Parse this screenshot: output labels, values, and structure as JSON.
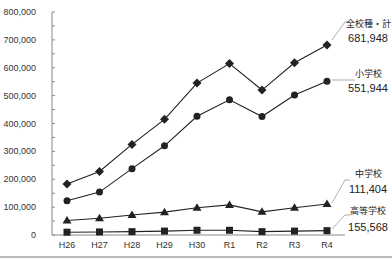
{
  "chart_data": {
    "type": "line",
    "title": "",
    "xlabel": "",
    "ylabel": "",
    "ylim": [
      0,
      800000
    ],
    "y_ticks": [
      "0",
      "100,000",
      "200,000",
      "300,000",
      "400,000",
      "500,000",
      "600,000",
      "700,000",
      "800,000"
    ],
    "categories": [
      "H26",
      "H27",
      "H28",
      "H29",
      "H30",
      "R1",
      "R2",
      "R3",
      "R4"
    ],
    "grid": false,
    "legend_position": "right (direct labels)",
    "series": [
      {
        "name": "全校種・計",
        "marker": "diamond",
        "end_label": "681,948",
        "values": [
          183000,
          228000,
          325000,
          415000,
          545000,
          615000,
          520000,
          618000,
          681948
        ]
      },
      {
        "name": "小学校",
        "marker": "circle",
        "end_label": "551,944",
        "values": [
          123000,
          154000,
          238000,
          320000,
          426000,
          485000,
          425000,
          502000,
          551944
        ]
      },
      {
        "name": "中学校",
        "marker": "triangle",
        "end_label": "111,404",
        "values": [
          52000,
          60000,
          72000,
          82000,
          98000,
          108000,
          83000,
          98000,
          111404
        ]
      },
      {
        "name": "高等学校",
        "marker": "square",
        "end_label": "155,568",
        "values": [
          10000,
          11000,
          12000,
          14000,
          17000,
          17000,
          12000,
          14000,
          15557
        ]
      }
    ]
  },
  "colors": {
    "line": "#222222",
    "axis": "#888888",
    "leader": "#999999"
  }
}
